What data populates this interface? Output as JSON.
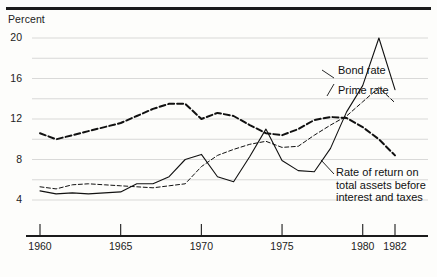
{
  "chart_data": {
    "type": "line",
    "title": "",
    "subtitle": "",
    "ylabel": "Percent",
    "xlabel": "",
    "ylim": [
      2,
      21
    ],
    "xlim": [
      1960,
      1982
    ],
    "yticks": [
      4,
      8,
      12,
      16,
      20
    ],
    "yticks_minor": [
      6,
      10,
      14,
      18
    ],
    "xticks": [
      1960,
      1965,
      1970,
      1975,
      1980,
      1982
    ],
    "grid": "horizontal",
    "legend_position": "inline-right-annotations",
    "x": [
      1960,
      1961,
      1962,
      1963,
      1964,
      1965,
      1966,
      1967,
      1968,
      1969,
      1970,
      1971,
      1972,
      1973,
      1974,
      1975,
      1976,
      1977,
      1978,
      1979,
      1980,
      1981,
      1982
    ],
    "series": [
      {
        "name": "Bond rate",
        "style": "dashed",
        "values": [
          10.6,
          10.0,
          10.4,
          10.8,
          11.2,
          11.6,
          12.3,
          13.0,
          13.5,
          13.5,
          12.0,
          12.6,
          12.3,
          11.4,
          10.6,
          10.4,
          11.0,
          11.9,
          12.2,
          12.1,
          11.2,
          10.0,
          8.4
        ]
      },
      {
        "name": "Prime rate",
        "style": "solid",
        "values": [
          4.9,
          4.6,
          4.7,
          4.6,
          4.7,
          4.8,
          5.6,
          5.6,
          6.3,
          8.0,
          8.5,
          6.3,
          5.8,
          8.3,
          11.0,
          7.9,
          6.9,
          6.8,
          9.1,
          12.7,
          15.3,
          20.0,
          14.9
        ]
      },
      {
        "name": "Rate of return on total assets before interest and taxes",
        "style": "dashed-fine",
        "values": [
          5.3,
          5.1,
          5.5,
          5.6,
          5.5,
          5.4,
          5.3,
          5.2,
          5.4,
          5.6,
          7.3,
          8.4,
          9.0,
          9.5,
          9.8,
          9.2,
          9.3,
          10.4,
          11.4,
          12.3,
          13.7,
          15.1,
          13.6
        ]
      }
    ],
    "annotations": [
      {
        "id": "bond-rate",
        "text": "Bond rate"
      },
      {
        "id": "prime-rate",
        "text": "Prime rate"
      },
      {
        "id": "rate-of-return",
        "text": "Rate of return on\ntotal assets before\ninterest and taxes"
      }
    ]
  }
}
